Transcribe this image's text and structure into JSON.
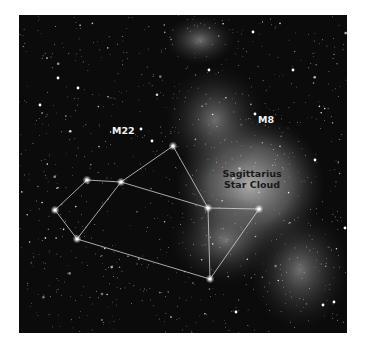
{
  "figure": {
    "labels": {
      "m22": "M22",
      "m8": "M8",
      "star_cloud_line1": "Sagittarius",
      "star_cloud_line2": "Star Cloud"
    },
    "colors": {
      "sky": "#0b0b0b",
      "milky_way": "#bdbdbd",
      "constellation_lines": "#d9d9d9",
      "label_light": "#f2f2f2",
      "label_dark": "#1a1a1a"
    },
    "asterism_stars": [
      {
        "id": "s1",
        "x": 87,
        "y": 180
      },
      {
        "id": "s2",
        "x": 121,
        "y": 182
      },
      {
        "id": "s3",
        "x": 55,
        "y": 210
      },
      {
        "id": "s4",
        "x": 77,
        "y": 239
      },
      {
        "id": "s5",
        "x": 173,
        "y": 146
      },
      {
        "id": "s6",
        "x": 208,
        "y": 208
      },
      {
        "id": "s7",
        "x": 259,
        "y": 209
      },
      {
        "id": "s8",
        "x": 210,
        "y": 279
      }
    ],
    "asterism_lines": [
      [
        "s1",
        "s2"
      ],
      [
        "s1",
        "s3"
      ],
      [
        "s3",
        "s4"
      ],
      [
        "s4",
        "s2"
      ],
      [
        "s2",
        "s5"
      ],
      [
        "s5",
        "s6"
      ],
      [
        "s2",
        "s6"
      ],
      [
        "s6",
        "s7"
      ],
      [
        "s6",
        "s8"
      ],
      [
        "s7",
        "s8"
      ],
      [
        "s4",
        "s8"
      ]
    ]
  }
}
